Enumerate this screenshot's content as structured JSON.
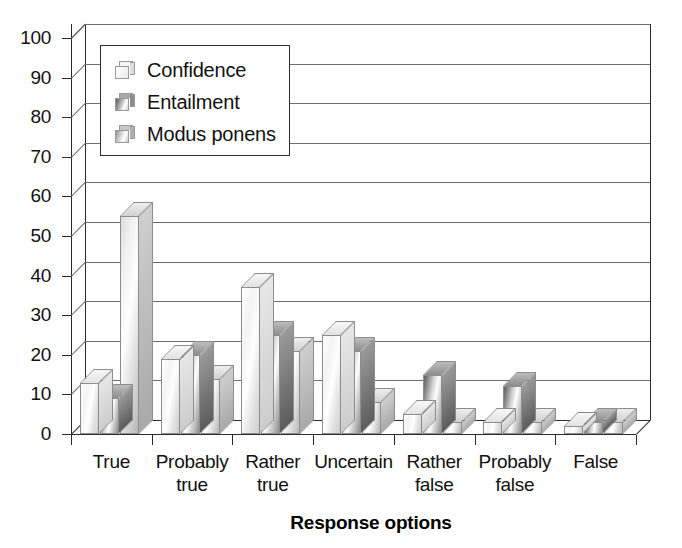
{
  "chart_data": {
    "type": "bar",
    "title": "",
    "xlabel": "Response options",
    "ylabel": "",
    "ylim": [
      0,
      100
    ],
    "ytick_step": 10,
    "yticks": [
      "100",
      "90",
      "80",
      "70",
      "60",
      "50",
      "40",
      "30",
      "20",
      "10",
      "0"
    ],
    "grid": "horizontal",
    "legend_position": "upper-left-inside",
    "style": "3d-clustered-column",
    "categories": [
      "True",
      "Probably true",
      "Rather true",
      "Uncertain",
      "Rather false",
      "Probably false",
      "False"
    ],
    "category_lines": [
      [
        "True"
      ],
      [
        "Probably",
        "true"
      ],
      [
        "Rather",
        "true"
      ],
      [
        "Uncertain"
      ],
      [
        "Rather",
        "false"
      ],
      [
        "Probably",
        "false"
      ],
      [
        "False"
      ]
    ],
    "series": [
      {
        "name": "Confidence",
        "color": "#f0f0f0",
        "values": [
          13,
          19,
          37,
          25,
          5,
          3,
          2
        ]
      },
      {
        "name": "Entailment",
        "color": "#6e6e6e",
        "values": [
          9,
          20,
          25,
          21,
          15,
          12,
          3
        ]
      },
      {
        "name": "Modus ponens",
        "color": "#c4c4c4",
        "values": [
          55,
          14,
          21,
          8,
          3,
          3,
          3
        ]
      }
    ]
  },
  "legend": {
    "entries": [
      {
        "label": "Confidence"
      },
      {
        "label": "Entailment"
      },
      {
        "label": "Modus ponens"
      }
    ]
  },
  "axis": {
    "x_title": "Response options"
  }
}
